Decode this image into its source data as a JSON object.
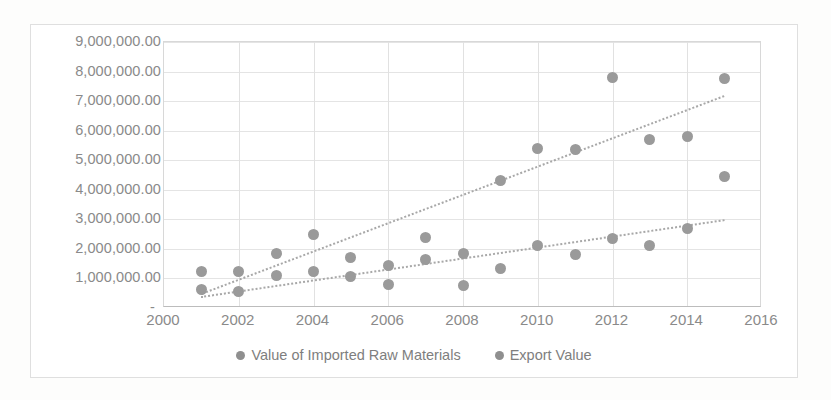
{
  "chart_data": {
    "type": "scatter",
    "title": "",
    "xlabel": "",
    "ylabel": "",
    "xlim": [
      2000,
      2016
    ],
    "ylim": [
      0,
      9000000
    ],
    "grid": true,
    "legend_position": "bottom",
    "x_ticks": [
      "2000",
      "2002",
      "2004",
      "2006",
      "2008",
      "2010",
      "2012",
      "2014",
      "2016"
    ],
    "x_tick_values": [
      2000,
      2002,
      2004,
      2006,
      2008,
      2010,
      2012,
      2014,
      2016
    ],
    "y_ticks": [
      "9,000,000.00",
      "8,000,000.00",
      "7,000,000.00",
      "6,000,000.00",
      "5,000,000.00",
      "4,000,000.00",
      "3,000,000.00",
      "2,000,000.00",
      "1,000,000.00",
      "-"
    ],
    "y_tick_values": [
      9000000,
      8000000,
      7000000,
      6000000,
      5000000,
      4000000,
      3000000,
      2000000,
      1000000,
      0
    ],
    "x": [
      2001,
      2002,
      2003,
      2004,
      2005,
      2006,
      2007,
      2008,
      2009,
      2010,
      2011,
      2012,
      2013,
      2014,
      2015
    ],
    "series": [
      {
        "name": "Value of Imported Raw Materials",
        "color": "#9a9a9a",
        "values": [
          1250000,
          1250000,
          1850000,
          2500000,
          1700000,
          1450000,
          2400000,
          1850000,
          4300000,
          5400000,
          5350000,
          7800000,
          5700000,
          5800000,
          7750000
        ],
        "trendline": {
          "x0": 2001,
          "y0": 500000,
          "x1": 2015,
          "y1": 7200000
        }
      },
      {
        "name": "Export Value",
        "color": "#9a9a9a",
        "values": [
          620000,
          550000,
          1100000,
          1250000,
          1050000,
          780000,
          1650000,
          750000,
          1350000,
          2100000,
          1800000,
          2350000,
          2100000,
          2700000,
          4450000
        ],
        "trendline": {
          "x0": 2001,
          "y0": 400000,
          "x1": 2015,
          "y1": 3000000
        }
      }
    ]
  },
  "legend": {
    "items": [
      {
        "label": "Value of Imported Raw Materials"
      },
      {
        "label": "Export Value"
      }
    ]
  }
}
